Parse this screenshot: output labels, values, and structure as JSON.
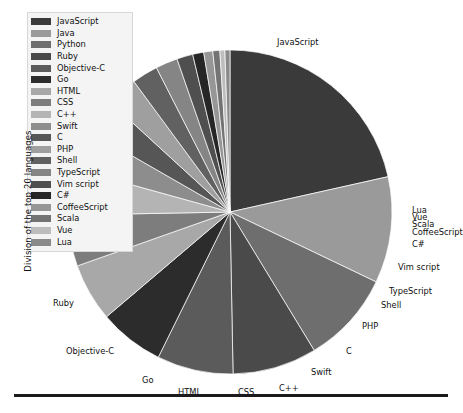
{
  "axis": {
    "ylabel": "Division of the top 20 languages"
  },
  "legend": {
    "name": "languages-legend",
    "items": [
      {
        "label": "JavaScript",
        "color": "#3a3a3a"
      },
      {
        "label": "Java",
        "color": "#9a9a9a"
      },
      {
        "label": "Python",
        "color": "#6e6e6e"
      },
      {
        "label": "Ruby",
        "color": "#4a4a4a"
      },
      {
        "label": "Objective-C",
        "color": "#5b5b5b"
      },
      {
        "label": "Go",
        "color": "#2c2c2c"
      },
      {
        "label": "HTML",
        "color": "#a8a8a8"
      },
      {
        "label": "CSS",
        "color": "#7d7d7d"
      },
      {
        "label": "C++",
        "color": "#b4b4b4"
      },
      {
        "label": "Swift",
        "color": "#8d8d8d"
      },
      {
        "label": "C",
        "color": "#565656"
      },
      {
        "label": "PHP",
        "color": "#9f9f9f"
      },
      {
        "label": "Shell",
        "color": "#616161"
      },
      {
        "label": "TypeScript",
        "color": "#858585"
      },
      {
        "label": "Vim script",
        "color": "#4f4f4f"
      },
      {
        "label": "C#",
        "color": "#262626"
      },
      {
        "label": "CoffeeScript",
        "color": "#969696"
      },
      {
        "label": "Scala",
        "color": "#737373"
      },
      {
        "label": "Vue",
        "color": "#bdbdbd"
      },
      {
        "label": "Lua",
        "color": "#8a8a8a"
      }
    ]
  },
  "callouts": [
    {
      "name": "callout-javascript",
      "label": "JavaScript",
      "x": 277,
      "y": 38,
      "align": "l"
    },
    {
      "name": "callout-lua",
      "label": "Lua",
      "x": 412,
      "y": 206,
      "align": "r"
    },
    {
      "name": "callout-vue",
      "label": "Vue",
      "x": 412,
      "y": 213,
      "align": "r"
    },
    {
      "name": "callout-scala",
      "label": "Scala",
      "x": 412,
      "y": 220,
      "align": "r"
    },
    {
      "name": "callout-coffeescript",
      "label": "CoffeeScript",
      "x": 412,
      "y": 228,
      "align": "r"
    },
    {
      "name": "callout-csharp",
      "label": "C#",
      "x": 412,
      "y": 240,
      "align": "r"
    },
    {
      "name": "callout-vimscript",
      "label": "Vim script",
      "x": 398,
      "y": 263,
      "align": "r"
    },
    {
      "name": "callout-typescript",
      "label": "TypeScript",
      "x": 389,
      "y": 287,
      "align": "r"
    },
    {
      "name": "callout-shell",
      "label": "Shell",
      "x": 381,
      "y": 301,
      "align": "r"
    },
    {
      "name": "callout-php",
      "label": "PHP",
      "x": 362,
      "y": 322,
      "align": "r"
    },
    {
      "name": "callout-c",
      "label": "C",
      "x": 346,
      "y": 347,
      "align": "r"
    },
    {
      "name": "callout-swift",
      "label": "Swift",
      "x": 311,
      "y": 368,
      "align": "r"
    },
    {
      "name": "callout-cplusplus",
      "label": "C++",
      "x": 279,
      "y": 384,
      "align": "r"
    },
    {
      "name": "callout-css",
      "label": "CSS",
      "x": 238,
      "y": 388,
      "align": "r"
    },
    {
      "name": "callout-html",
      "label": "HTML",
      "x": 178,
      "y": 388,
      "align": "r"
    },
    {
      "name": "callout-go",
      "label": "Go",
      "x": 142,
      "y": 376,
      "align": "r"
    },
    {
      "name": "callout-objectivec",
      "label": "Objective-C",
      "x": 66,
      "y": 347,
      "align": "r"
    },
    {
      "name": "callout-ruby",
      "label": "Ruby",
      "x": 53,
      "y": 299,
      "align": "r"
    }
  ],
  "chart_data": {
    "type": "pie",
    "title": "",
    "ylabel": "Division of the top 20 languages",
    "xlabel": "",
    "legend_position": "top-left",
    "grid": false,
    "start_angle_deg": 90,
    "direction": "clockwise",
    "center_px": [
      230,
      212
    ],
    "radius_px": 162,
    "categories": [
      "JavaScript",
      "Java",
      "Python",
      "Ruby",
      "Objective-C",
      "Go",
      "HTML",
      "CSS",
      "C++",
      "Swift",
      "C",
      "PHP",
      "Shell",
      "TypeScript",
      "Vim script",
      "C#",
      "CoffeeScript",
      "Scala",
      "Vue",
      "Lua"
    ],
    "values": [
      21.5,
      10.6,
      9.2,
      8.4,
      7.6,
      6.5,
      5.8,
      5.1,
      4.6,
      4.0,
      3.5,
      3.1,
      2.6,
      2.2,
      1.6,
      1.1,
      0.9,
      0.7,
      0.5,
      0.5
    ],
    "units": "percent",
    "colors": [
      "#3a3a3a",
      "#9a9a9a",
      "#6e6e6e",
      "#4a4a4a",
      "#5b5b5b",
      "#2c2c2c",
      "#a8a8a8",
      "#7d7d7d",
      "#b4b4b4",
      "#8d8d8d",
      "#565656",
      "#9f9f9f",
      "#616161",
      "#858585",
      "#4f4f4f",
      "#262626",
      "#969696",
      "#737373",
      "#bdbdbd",
      "#8a8a8a"
    ]
  },
  "baseline": {
    "name": "bottom-axis-rule"
  }
}
